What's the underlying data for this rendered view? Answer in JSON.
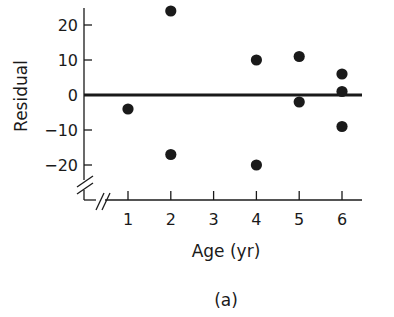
{
  "chart_data": {
    "type": "scatter",
    "title": "",
    "caption": "(a)",
    "xlabel": "Age (yr)",
    "ylabel": "Residual",
    "x_ticks": [
      1,
      2,
      3,
      4,
      5,
      6
    ],
    "y_ticks": [
      20,
      10,
      0,
      -10,
      -20
    ],
    "y_tick_labels": [
      "20",
      "10",
      "0",
      "−10",
      "−20"
    ],
    "xlim": [
      0,
      6.5
    ],
    "ylim": [
      -30,
      26
    ],
    "grid": false,
    "legend": null,
    "axis_breaks": [
      "x",
      "y"
    ],
    "reference_line": {
      "y": 0,
      "label": "zero residual line"
    },
    "points": [
      {
        "x": 1,
        "y": -4
      },
      {
        "x": 2,
        "y": 24
      },
      {
        "x": 2,
        "y": -17
      },
      {
        "x": 4,
        "y": 10
      },
      {
        "x": 4,
        "y": -20
      },
      {
        "x": 5,
        "y": 11
      },
      {
        "x": 5,
        "y": -2
      },
      {
        "x": 6,
        "y": 6
      },
      {
        "x": 6,
        "y": 1
      },
      {
        "x": 6,
        "y": -9
      }
    ],
    "colors": {
      "ink": "#1a1a1a",
      "background": "#ffffff"
    }
  }
}
